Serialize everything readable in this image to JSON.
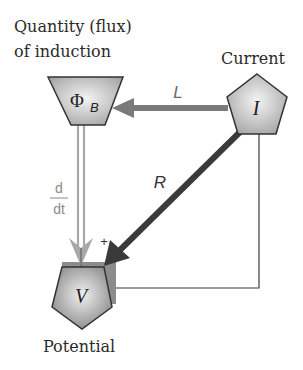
{
  "labels": {
    "flux_line1": "Quantity (flux)",
    "flux_line2": "of induction",
    "current": "Current",
    "potential": "Potential"
  },
  "nodes": {
    "flux": {
      "symbol": "Φ",
      "subscript": "B",
      "shape": "trapezoid"
    },
    "current": {
      "symbol": "I",
      "shape": "pentagon"
    },
    "potential": {
      "symbol": "V",
      "shape": "pentagon"
    }
  },
  "edges": {
    "inductance": {
      "label": "L",
      "from": "current",
      "to": "flux"
    },
    "resistance": {
      "label": "R",
      "from": "current",
      "to": "potential"
    },
    "derivative": {
      "numerator": "d",
      "denominator": "dt",
      "from": "flux",
      "to": "potential"
    },
    "sign": "+"
  },
  "colors": {
    "node_fill_light": "#eeeeee",
    "node_fill_dark": "#9a9a9a",
    "stroke": "#333333",
    "arrow_L": "#7a7a7a",
    "arrow_R": "#3a3a3a",
    "arrow_ddt": "#a8a8a8",
    "text_gray": "#8a8a8a"
  }
}
